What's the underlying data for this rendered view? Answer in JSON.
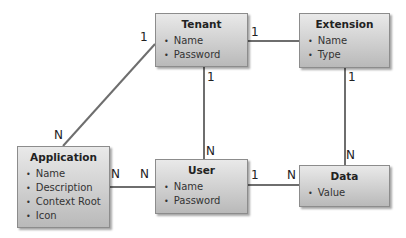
{
  "entities": {
    "tenant": {
      "title": "Tenant",
      "attributes": [
        "Name",
        "Password"
      ]
    },
    "extension": {
      "title": "Extension",
      "attributes": [
        "Name",
        "Type"
      ]
    },
    "application": {
      "title": "Application",
      "attributes": [
        "Name",
        "Description",
        "Context Root",
        "Icon"
      ]
    },
    "user": {
      "title": "User",
      "attributes": [
        "Name",
        "Password"
      ]
    },
    "data": {
      "title": "Data",
      "attributes": [
        "Value"
      ]
    }
  },
  "relationships": [
    {
      "from": "Tenant",
      "to": "Extension",
      "from_card": "1",
      "to_card": "1"
    },
    {
      "from": "Tenant",
      "to": "Application",
      "from_card": "1",
      "to_card": "N"
    },
    {
      "from": "Tenant",
      "to": "User",
      "from_card": "1",
      "to_card": "N"
    },
    {
      "from": "Extension",
      "to": "Data",
      "from_card": "1",
      "to_card": "N"
    },
    {
      "from": "Application",
      "to": "User",
      "from_card": "N",
      "to_card": "N"
    },
    {
      "from": "User",
      "to": "Data",
      "from_card": "1",
      "to_card": "N"
    }
  ],
  "labels": {
    "tenant_app_1": "1",
    "tenant_app_n": "N",
    "tenant_ext_1a": "1",
    "tenant_user_1": "1",
    "tenant_user_n": "N",
    "ext_data_1": "1",
    "ext_data_n": "N",
    "app_user_n1": "N",
    "app_user_n2": "N",
    "user_data_1": "1",
    "user_data_n": "N"
  }
}
